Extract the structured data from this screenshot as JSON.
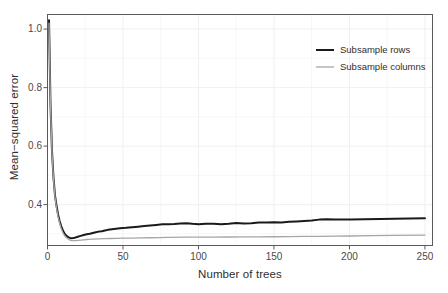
{
  "chart_data": {
    "type": "line",
    "title": "",
    "xlabel": "Number of trees",
    "ylabel": "Mean−squared error",
    "xlim": [
      0,
      255
    ],
    "ylim": [
      0.26,
      1.05
    ],
    "xticks": [
      0,
      50,
      100,
      150,
      200,
      250
    ],
    "xtick_labels": [
      "0",
      "50",
      "100",
      "150",
      "200",
      "250"
    ],
    "yticks": [
      0.4,
      0.6,
      0.8,
      1.0
    ],
    "ytick_labels": [
      "0.4",
      "0.6",
      "0.8",
      "1.0"
    ],
    "grid": true,
    "legend_position": "top-right",
    "series": [
      {
        "name": "Subsample rows",
        "color": "#1a1a1a",
        "width": 2.0,
        "x": [
          1,
          2,
          3,
          4,
          5,
          6,
          7,
          8,
          9,
          10,
          11,
          12,
          13,
          14,
          15,
          16,
          17,
          18,
          19,
          20,
          22,
          24,
          26,
          28,
          30,
          32,
          34,
          36,
          38,
          40,
          44,
          48,
          52,
          56,
          60,
          64,
          68,
          72,
          76,
          80,
          84,
          88,
          92,
          96,
          100,
          105,
          110,
          115,
          120,
          125,
          130,
          135,
          140,
          145,
          150,
          155,
          160,
          165,
          170,
          175,
          180,
          185,
          190,
          195,
          200,
          210,
          220,
          230,
          240,
          250
        ],
        "y": [
          1.03,
          0.74,
          0.58,
          0.49,
          0.43,
          0.395,
          0.366,
          0.344,
          0.327,
          0.314,
          0.303,
          0.296,
          0.291,
          0.288,
          0.286,
          0.285,
          0.2855,
          0.2865,
          0.288,
          0.29,
          0.293,
          0.296,
          0.2985,
          0.3,
          0.303,
          0.3055,
          0.3075,
          0.3085,
          0.311,
          0.3135,
          0.3165,
          0.319,
          0.3205,
          0.3225,
          0.3245,
          0.3265,
          0.3285,
          0.3305,
          0.3325,
          0.333,
          0.3335,
          0.3355,
          0.3365,
          0.3345,
          0.333,
          0.3345,
          0.3345,
          0.333,
          0.3345,
          0.337,
          0.3355,
          0.3365,
          0.3385,
          0.3385,
          0.3395,
          0.339,
          0.341,
          0.3425,
          0.344,
          0.3455,
          0.3485,
          0.3495,
          0.3485,
          0.349,
          0.349,
          0.3495,
          0.3505,
          0.3515,
          0.352,
          0.3535
        ]
      },
      {
        "name": "Subsample columns",
        "color": "#a6a6a6",
        "width": 1.3,
        "x": [
          1,
          2,
          3,
          4,
          5,
          6,
          7,
          8,
          9,
          10,
          11,
          12,
          13,
          14,
          15,
          16,
          17,
          18,
          19,
          20,
          22,
          24,
          26,
          28,
          30,
          34,
          38,
          42,
          46,
          50,
          56,
          62,
          68,
          74,
          80,
          90,
          100,
          110,
          120,
          130,
          140,
          150,
          160,
          170,
          180,
          190,
          200,
          215,
          230,
          250
        ],
        "y": [
          1.02,
          0.735,
          0.575,
          0.485,
          0.425,
          0.388,
          0.359,
          0.337,
          0.32,
          0.306,
          0.296,
          0.29,
          0.285,
          0.281,
          0.2785,
          0.277,
          0.2765,
          0.2765,
          0.277,
          0.2775,
          0.2785,
          0.2795,
          0.2805,
          0.281,
          0.2815,
          0.2825,
          0.2835,
          0.284,
          0.2845,
          0.285,
          0.2855,
          0.286,
          0.2865,
          0.287,
          0.2875,
          0.2885,
          0.2885,
          0.2885,
          0.289,
          0.2895,
          0.2895,
          0.29,
          0.2905,
          0.291,
          0.2915,
          0.292,
          0.2925,
          0.2935,
          0.2945,
          0.2955
        ]
      }
    ]
  },
  "legend": {
    "entries": [
      {
        "label": "Subsample rows"
      },
      {
        "label": "Subsample columns"
      }
    ]
  },
  "colors": {
    "series_rows": "#1a1a1a",
    "series_columns": "#a6a6a6",
    "panel_border": "#5a5a5a",
    "grid_major": "#f0f0f0",
    "grid_minor": "#f7f7f7",
    "background": "#ffffff"
  }
}
